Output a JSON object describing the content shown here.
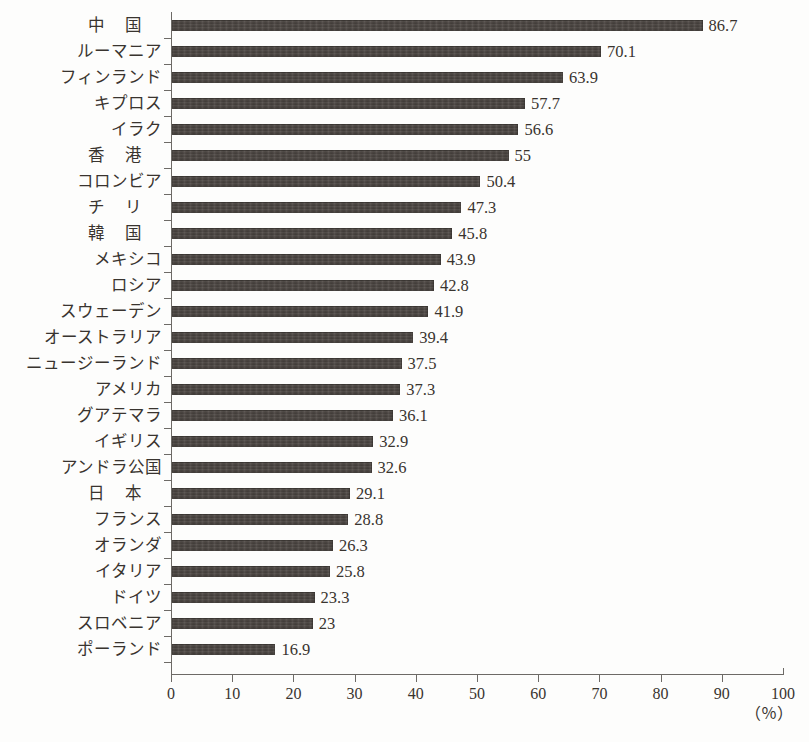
{
  "title_remnant": "",
  "colors": {
    "bar": "#4a4440",
    "axis": "#6d6a66",
    "text": "#39342f",
    "background": "#fdfdfc"
  },
  "axis": {
    "unit_label": "（％）",
    "x_ticks": [
      "0",
      "10",
      "20",
      "30",
      "40",
      "50",
      "60",
      "70",
      "80",
      "90",
      "100"
    ]
  },
  "chart_data": {
    "type": "bar",
    "orientation": "horizontal",
    "title": "",
    "xlabel": "（％）",
    "ylabel": "",
    "xlim": [
      0,
      100
    ],
    "grid": false,
    "legend": null,
    "categories": [
      "中国",
      "ルーマニア",
      "フィンランド",
      "キプロス",
      "イラク",
      "香港",
      "コロンビア",
      "チリ",
      "韓国",
      "メキシコ",
      "ロシア",
      "スウェーデン",
      "オーストラリア",
      "ニュージーランド",
      "アメリカ",
      "グアテマラ",
      "イギリス",
      "アンドラ公国",
      "日本",
      "フランス",
      "オランダ",
      "イタリア",
      "ドイツ",
      "スロベニア",
      "ポーランド"
    ],
    "values": [
      86.7,
      70.1,
      63.9,
      57.7,
      56.6,
      55,
      50.4,
      47.3,
      45.8,
      43.9,
      42.8,
      41.9,
      39.4,
      37.5,
      37.3,
      36.1,
      32.9,
      32.6,
      29.1,
      28.8,
      26.3,
      25.8,
      23.3,
      23,
      16.9
    ],
    "value_labels": [
      "86.7",
      "70.1",
      "63.9",
      "57.7",
      "56.6",
      "55",
      "50.4",
      "47.3",
      "45.8",
      "43.9",
      "42.8",
      "41.9",
      "39.4",
      "37.5",
      "37.3",
      "36.1",
      "32.9",
      "32.6",
      "29.1",
      "28.8",
      "26.3",
      "25.8",
      "23.3",
      "23",
      "16.9"
    ],
    "wide_spaced_categories": [
      "中国",
      "香港",
      "チリ",
      "韓国",
      "日本"
    ]
  }
}
